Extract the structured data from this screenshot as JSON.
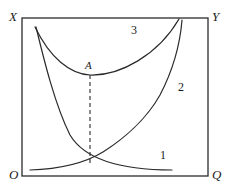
{
  "figure": {
    "kind": "economics-cost-curve-diagram",
    "background_color": "#ffffff",
    "line_color": "#2b2b2b",
    "frame": {
      "name": "plot-frame",
      "x": 22,
      "y": 18,
      "width": 186,
      "height": 158,
      "stroke_width": 1.2
    },
    "axis_labels": [
      {
        "id": "X",
        "text": "X",
        "corner": "top-left",
        "x": 9,
        "y": 10
      },
      {
        "id": "Y",
        "text": "Y",
        "corner": "top-right",
        "x": 212,
        "y": 10
      },
      {
        "id": "O",
        "text": "O",
        "corner": "bottom-left",
        "x": 9,
        "y": 168
      },
      {
        "id": "Q",
        "text": "Q",
        "corner": "bottom-right",
        "x": 212,
        "y": 168
      }
    ],
    "point_labels": [
      {
        "id": "A",
        "text": "A",
        "x": 85,
        "y": 60,
        "describes": "minimum point of curve 3"
      }
    ],
    "curve_labels": [
      {
        "id": "1",
        "text": "1",
        "x": 160,
        "y": 149,
        "for_curve": "curve-1"
      },
      {
        "id": "2",
        "text": "2",
        "x": 178,
        "y": 81,
        "for_curve": "curve-2"
      },
      {
        "id": "3",
        "text": "3",
        "x": 131,
        "y": 24,
        "for_curve": "curve-3"
      }
    ],
    "dashed_line": {
      "name": "vertical-dashed-line-at-A",
      "x": 90,
      "y_top": 75,
      "y_bottom": 166,
      "dash_pattern": "4,3"
    }
  },
  "chart_data": {
    "type": "line",
    "title": "",
    "xlabel": "",
    "ylabel": "",
    "xlim": [
      22,
      208
    ],
    "ylim": [
      176,
      18
    ],
    "grid": false,
    "legend": "inline-numeric-labels",
    "axis_corner_labels": {
      "top_left": "X",
      "top_right": "Y",
      "bottom_left": "O",
      "bottom_right": "Q"
    },
    "annotations": [
      {
        "label": "A",
        "x": 90,
        "y": 75,
        "note": "minimum of curve 3, dashed drop-line to curve 1"
      }
    ],
    "series": [
      {
        "name": "1",
        "description": "rising then flattening curve from lower-left to lower-right region",
        "path": "M 30 170 C 60 169, 85 163, 103 152 C 122 140, 146 120, 160 95 C 172 72, 180 45, 182 20",
        "label_position": {
          "x": 160,
          "y": 149
        }
      },
      {
        "name": "2",
        "description": "steeply falling convex curve from upper-left to lower-right",
        "path": "M 36 27 C 44 60, 55 105, 70 135 C 85 160, 120 170, 172 170",
        "label_position": {
          "x": 178,
          "y": 81
        }
      },
      {
        "name": "3",
        "description": "U-shaped curve with minimum at point A",
        "path": "M 35 27 C 50 58, 70 74, 90 75 C 120 76, 158 55, 179 19",
        "label_position": {
          "x": 131,
          "y": 24
        }
      }
    ]
  }
}
